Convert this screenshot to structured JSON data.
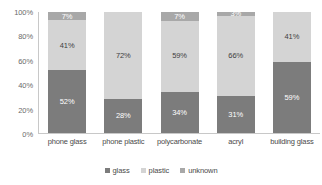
{
  "chart_data": {
    "type": "bar",
    "title": "",
    "subtitle": "",
    "xlabel": "",
    "ylabel": "",
    "stacked": true,
    "normalized": "100%",
    "grid": false,
    "legend_position": "bottom-center",
    "ylim": [
      0,
      100
    ],
    "y_ticks": [
      "0%",
      "20%",
      "40%",
      "60%",
      "80%",
      "100%"
    ],
    "categories": [
      "phone glass",
      "phone plastic",
      "polycarbonate",
      "acryl",
      "building glass"
    ],
    "series": [
      {
        "name": "glass",
        "color": "#7c7c7c",
        "values": [
          52,
          28,
          34,
          31,
          59
        ]
      },
      {
        "name": "plastic",
        "color": "#d4d4d4",
        "values": [
          41,
          72,
          59,
          66,
          41
        ]
      },
      {
        "name": "unknown",
        "color": "#a8a8a8",
        "values": [
          7,
          0,
          7,
          3,
          0
        ]
      }
    ],
    "bar_labels": [
      {
        "category": "phone glass",
        "glass": "52%",
        "plastic": "41%",
        "unknown": "7%"
      },
      {
        "category": "phone plastic",
        "glass": "28%",
        "plastic": "72%",
        "unknown": ""
      },
      {
        "category": "polycarbonate",
        "glass": "34%",
        "plastic": "59%",
        "unknown": "7%"
      },
      {
        "category": "acryl",
        "glass": "31%",
        "plastic": "66%",
        "unknown": "3%"
      },
      {
        "category": "building glass",
        "glass": "59%",
        "plastic": "41%",
        "unknown": ""
      }
    ]
  },
  "axis": {
    "y_ticks": [
      {
        "label": "100%",
        "value": 100
      },
      {
        "label": "80%",
        "value": 80
      },
      {
        "label": "60%",
        "value": 60
      },
      {
        "label": "40%",
        "value": 40
      },
      {
        "label": "20%",
        "value": 20
      },
      {
        "label": "0%",
        "value": 0
      }
    ]
  },
  "legend": {
    "items": [
      {
        "label": "glass",
        "color": "#7c7c7c"
      },
      {
        "label": "plastic",
        "color": "#d4d4d4"
      },
      {
        "label": "unknown",
        "color": "#a8a8a8"
      }
    ]
  }
}
